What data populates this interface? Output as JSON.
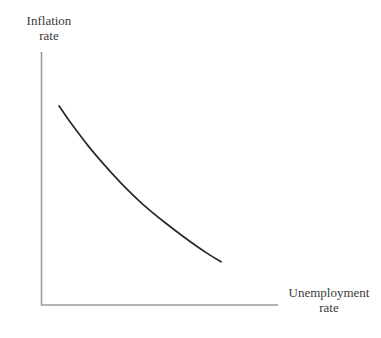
{
  "figure": {
    "background_color": "#ffffff",
    "axis_color": "#9a9a9a",
    "curve_color": "#2a2a2a",
    "text_color": "#3a3a3a"
  },
  "labels": {
    "y_axis": {
      "line1": "Inflation",
      "line2": "rate",
      "full": "Inflation rate"
    },
    "x_axis": {
      "line1": "Unemployment",
      "line2": "rate",
      "full": "Unemployment rate"
    }
  },
  "chart_data": {
    "type": "line",
    "title": "",
    "xlabel": "Unemployment rate",
    "ylabel": "Inflation rate",
    "grid": false,
    "legend": null,
    "axis_ticks": {
      "x": [],
      "y": []
    },
    "xlim": [
      0,
      1
    ],
    "ylim": [
      0,
      1
    ],
    "series": [
      {
        "name": "Phillips curve",
        "description": "Downward-sloping convex curve: inflation rate falls as unemployment rate rises",
        "shape": "convex-decreasing",
        "x": [
          0.076,
          0.13,
          0.2,
          0.27,
          0.35,
          0.43,
          0.52,
          0.61,
          0.7,
          0.76
        ],
        "y": [
          0.787,
          0.714,
          0.628,
          0.551,
          0.47,
          0.398,
          0.328,
          0.264,
          0.205,
          0.171
        ]
      }
    ]
  }
}
